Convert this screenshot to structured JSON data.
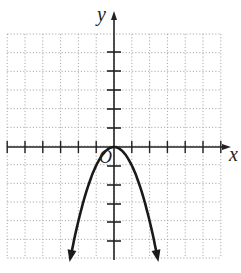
{
  "chart_data": {
    "type": "line",
    "title": "",
    "xlabel": "x",
    "ylabel": "y",
    "origin_label": "O",
    "function": "y = -x^2",
    "xlim": [
      -6,
      6
    ],
    "ylim": [
      -6,
      6
    ],
    "grid": true,
    "grid_style": "dotted",
    "x_ticks": [
      -6,
      -5,
      -4,
      -3,
      -2,
      -1,
      1,
      2,
      3,
      4,
      5,
      6
    ],
    "y_ticks": [
      -5,
      -4,
      -3,
      -2,
      -1,
      1,
      2,
      3,
      4,
      5
    ],
    "series": [
      {
        "name": "parabola",
        "x": [
          -2.45,
          -2,
          -1.5,
          -1,
          -0.5,
          0,
          0.5,
          1,
          1.5,
          2,
          2.45
        ],
        "y": [
          -6,
          -4,
          -2.25,
          -1,
          -0.25,
          0,
          -0.25,
          -1,
          -2.25,
          -4,
          -6
        ],
        "arrows_at_ends": true,
        "color": "#1a1a1a"
      }
    ]
  },
  "colors": {
    "axis": "#222222",
    "grid": "#aaaaaa",
    "curve": "#1a1a1a"
  }
}
